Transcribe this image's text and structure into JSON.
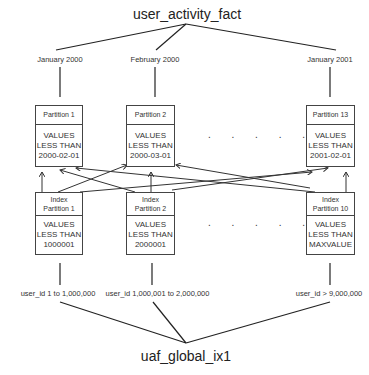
{
  "top_table": "user_activity_fact",
  "bottom_index": "uaf_global_ix1",
  "table_partitions": [
    {
      "period": "January 2000",
      "name": "Partition 1",
      "bound_line1": "VALUES",
      "bound_line2": "LESS THAN",
      "bound_value": "2000-02-01"
    },
    {
      "period": "February 2000",
      "name": "Partition 2",
      "bound_line1": "VALUES",
      "bound_line2": "LESS THAN",
      "bound_value": "2000-03-01"
    },
    {
      "period": "January 2001",
      "name": "Partition 13",
      "bound_line1": "VALUES",
      "bound_line2": "LESS THAN",
      "bound_value": "2001-02-01"
    }
  ],
  "index_partitions": [
    {
      "name_line1": "Index",
      "name_line2": "Partition 1",
      "bound_line1": "VALUES",
      "bound_line2": "LESS THAN",
      "bound_value": "1000001",
      "range": "user_id 1 to 1,000,000"
    },
    {
      "name_line1": "Index",
      "name_line2": "Partition 2",
      "bound_line1": "VALUES",
      "bound_line2": "LESS THAN",
      "bound_value": "2000001",
      "range": "user_id 1,000,001 to 2,000,000"
    },
    {
      "name_line1": "Index",
      "name_line2": "Partition 10",
      "bound_line1": "VALUES",
      "bound_line2": "LESS THAN",
      "bound_value": "MAXVALUE",
      "range": "user_id  > 9,000,000"
    }
  ],
  "ellipsis": ". . . . ."
}
